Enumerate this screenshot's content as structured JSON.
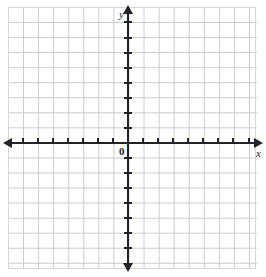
{
  "figure": {
    "type": "coordinate-plane",
    "title": ""
  },
  "labels": {
    "y_axis": "y",
    "x_axis": "x",
    "origin": "0"
  },
  "colors": {
    "grid_line": "#c9c9cf",
    "axis": "#222228",
    "background": "#ffffff",
    "label_text": "#222228"
  },
  "chart_data": {
    "type": "scatter",
    "title": "",
    "xlabel": "x",
    "ylabel": "y",
    "series": [],
    "x": [],
    "values": [],
    "xlim": [
      -8,
      9
    ],
    "ylim": [
      -8,
      9
    ],
    "grid": true,
    "legend": "none",
    "origin_label": "0",
    "grid_spacing": 1,
    "tick_interval": 1,
    "x_ticks": [
      -7,
      -6,
      -5,
      -4,
      -3,
      -2,
      -1,
      1,
      2,
      3,
      4,
      5,
      6,
      7,
      8
    ],
    "y_ticks": [
      -7,
      -6,
      -5,
      -4,
      -3,
      -2,
      -1,
      1,
      2,
      3,
      4,
      5,
      6,
      7,
      8
    ],
    "x_tick_labels": [],
    "y_tick_labels": [],
    "annotations": [],
    "axis_arrows": [
      "left",
      "right",
      "up",
      "down"
    ]
  }
}
